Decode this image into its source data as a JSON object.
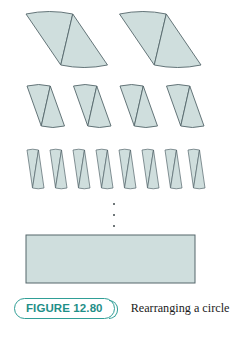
{
  "figure": {
    "badge_label": "FIGURE 12.80",
    "caption": "Rearranging a circle",
    "ellipsis_symbol": "vertical-ellipsis",
    "colors": {
      "fill": "#cfdedd",
      "stroke": "#55666b",
      "badge_border": "#2f9e96",
      "badge_text": "#1f8f88",
      "caption_text": "#1b1b1b",
      "background": "#ffffff"
    }
  },
  "chart_data": {
    "type": "diagram",
    "title": "Rearranging a circle",
    "rows": [
      {
        "name": "row-1-four-sectors",
        "sector_count": 4,
        "x_start": 14,
        "x_end": 201,
        "y_top": 14,
        "y_bottom": 65,
        "skew": 12,
        "arc_bulge": 5
      },
      {
        "name": "row-2-eight-sectors",
        "sector_count": 8,
        "x_start": 18,
        "x_end": 204,
        "y_top": 86,
        "y_bottom": 126,
        "skew": 9,
        "arc_bulge": 3
      },
      {
        "name": "row-3-sixteen-sectors",
        "sector_count": 16,
        "x_start": 21,
        "x_end": 205,
        "y_top": 150,
        "y_bottom": 188,
        "skew": 6,
        "arc_bulge": 1.6
      }
    ],
    "limit_shape": {
      "name": "limit-rectangle",
      "x": 26,
      "y": 235,
      "width": 169,
      "height": 48
    }
  }
}
